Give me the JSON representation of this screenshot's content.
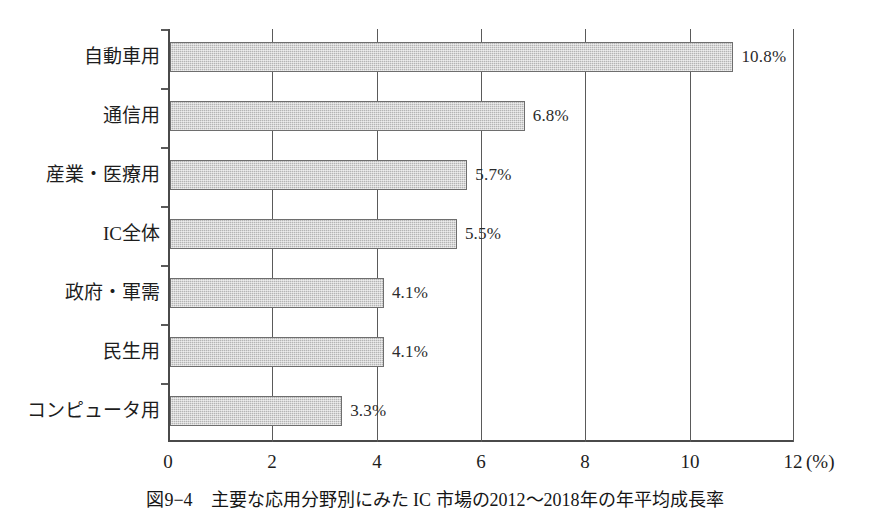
{
  "chart_data": {
    "type": "bar",
    "orientation": "horizontal",
    "title": "",
    "xlabel": "(%)",
    "ylabel": "",
    "xlim": [
      0,
      12
    ],
    "xticks": [
      0,
      2,
      4,
      6,
      8,
      10,
      12
    ],
    "xtick_labels": [
      "0",
      "2",
      "4",
      "6",
      "8",
      "10",
      "12"
    ],
    "grid": "vertical",
    "legend": "none",
    "categories": [
      "自動車用",
      "通信用",
      "産業・医療用",
      "IC全体",
      "政府・軍需",
      "民生用",
      "コンピュータ用"
    ],
    "values": [
      10.8,
      6.8,
      5.7,
      5.5,
      4.1,
      4.1,
      3.3
    ],
    "value_labels": [
      "10.8%",
      "6.8%",
      "5.7%",
      "5.5%",
      "4.1%",
      "4.1%",
      "3.3%"
    ],
    "unit": "%",
    "bar_fill_color": "#b4b4b4",
    "bar_border_color": "#6e6e6e"
  },
  "caption": {
    "text": "図9−4　主要な応用分野別にみた IC 市場の2012〜2018年の年平均成長率"
  },
  "axis": {
    "unit_label": "(%)"
  }
}
